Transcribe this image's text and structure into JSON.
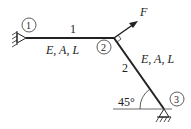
{
  "diagram": {
    "type": "truss-structure",
    "nodes": [
      {
        "id": "1",
        "label": "1",
        "support": "pin"
      },
      {
        "id": "2",
        "label": "2",
        "support": "none"
      },
      {
        "id": "3",
        "label": "3",
        "support": "pin"
      }
    ],
    "bars": [
      {
        "id": "1",
        "label": "1",
        "properties": "E, A, L",
        "from": "1",
        "to": "2"
      },
      {
        "id": "2",
        "label": "2",
        "properties": "E, A, L",
        "from": "2",
        "to": "3"
      }
    ],
    "load": {
      "label": "F",
      "node": "2",
      "direction": "perpendicular to bar 2"
    },
    "angle": {
      "label": "45°",
      "node": "3"
    },
    "colors": {
      "line": "#222222",
      "background": "#ffffff"
    }
  }
}
